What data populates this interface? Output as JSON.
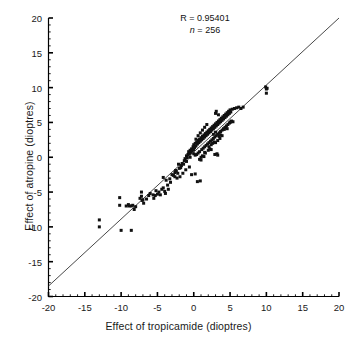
{
  "figure": {
    "kind": "scatter-plot",
    "background": "#ffffff",
    "ink_color": "#000000",
    "marker_color": "#111111",
    "line_color": "#333333"
  },
  "annotation": {
    "correlation_label": "R = 0.95401",
    "n_symbol": "n",
    "n_equals": " = ",
    "n_value": "256",
    "n_label": "n = 256"
  },
  "axes": {
    "x_title": "Effect of tropicamide (dioptres)",
    "y_title": "Effect of atropine (dioptres)",
    "x_ticks": [
      "-20",
      "-15",
      "-10",
      "-5",
      "0",
      "5",
      "10",
      "15",
      "20"
    ],
    "y_ticks": [
      "20",
      "15",
      "10",
      "5",
      "0",
      "-5",
      "-10",
      "-15",
      "-20"
    ]
  },
  "chart_data": {
    "type": "scatter",
    "title": "",
    "subtitle": "",
    "xlabel": "Effect of tropicamide (dioptres)",
    "ylabel": "Effect of atropine (dioptres)",
    "xlim": [
      -20,
      20
    ],
    "ylim": [
      -20,
      20
    ],
    "xticks": [
      -20,
      -15,
      -10,
      -5,
      0,
      5,
      10,
      15,
      20
    ],
    "yticks": [
      -20,
      -15,
      -10,
      -5,
      0,
      5,
      10,
      15,
      20
    ],
    "minor_ticks": true,
    "grid": false,
    "legend": false,
    "annotations": [
      {
        "text": "R = 0.95401",
        "x": 0.5,
        "y": 18.3
      },
      {
        "text": "n = 256",
        "x": 0.5,
        "y": 16.6
      }
    ],
    "statistics": {
      "R": 0.95401,
      "n": 256
    },
    "reference_line": {
      "name": "regression-line",
      "type": "line",
      "x": [
        -20,
        20
      ],
      "y": [
        -18.5,
        20.0
      ],
      "slope": 0.9625,
      "intercept": 0.75,
      "color": "#333333"
    },
    "marker": {
      "shape": "square",
      "size": 3,
      "color": "#111111"
    },
    "series": [
      {
        "name": "eyes",
        "points": [
          [
            -13.0,
            -9.0
          ],
          [
            -13.0,
            -10.0
          ],
          [
            -10.0,
            -10.5
          ],
          [
            -8.6,
            -10.5
          ],
          [
            -9.3,
            -7.0
          ],
          [
            -8.9,
            -7.0
          ],
          [
            -8.6,
            -7.0
          ],
          [
            -8.2,
            -7.5
          ],
          [
            -10.2,
            -5.8
          ],
          [
            -10.2,
            -6.9
          ],
          [
            -7.2,
            -5.0
          ],
          [
            -7.2,
            -5.6
          ],
          [
            -7.1,
            -6.2
          ],
          [
            -6.9,
            -6.6
          ],
          [
            -6.2,
            -5.5
          ],
          [
            -5.6,
            -5.4
          ],
          [
            -5.3,
            -5.5
          ],
          [
            -5.0,
            -5.3
          ],
          [
            -4.6,
            -5.4
          ],
          [
            -4.4,
            -4.6
          ],
          [
            -4.2,
            -4.4
          ],
          [
            -3.9,
            -5.2
          ],
          [
            -3.6,
            -4.0
          ],
          [
            -3.3,
            -3.1
          ],
          [
            -3.0,
            -2.5
          ],
          [
            -2.8,
            -2.6
          ],
          [
            -2.6,
            -2.2
          ],
          [
            -2.4,
            -2.0
          ],
          [
            -2.2,
            -2.3
          ],
          [
            -2.0,
            -1.6
          ],
          [
            -1.9,
            -2.8
          ],
          [
            -1.7,
            -1.2
          ],
          [
            -1.6,
            -0.9
          ],
          [
            -1.4,
            -1.0
          ],
          [
            -1.3,
            -0.5
          ],
          [
            -1.2,
            -0.2
          ],
          [
            -1.0,
            0.2
          ],
          [
            -0.9,
            -0.1
          ],
          [
            -0.8,
            0.4
          ],
          [
            -0.7,
            0.8
          ],
          [
            -0.6,
            0.5
          ],
          [
            -0.5,
            1.0
          ],
          [
            -0.4,
            0.7
          ],
          [
            -0.3,
            1.2
          ],
          [
            -0.2,
            0.9
          ],
          [
            -0.1,
            1.5
          ],
          [
            0.0,
            1.1
          ],
          [
            0.0,
            1.8
          ],
          [
            0.1,
            1.4
          ],
          [
            0.2,
            2.0
          ],
          [
            0.3,
            1.6
          ],
          [
            0.4,
            2.2
          ],
          [
            0.5,
            1.9
          ],
          [
            0.6,
            2.4
          ],
          [
            0.7,
            2.1
          ],
          [
            0.8,
            2.6
          ],
          [
            0.9,
            2.3
          ],
          [
            1.0,
            2.8
          ],
          [
            1.1,
            2.5
          ],
          [
            1.2,
            3.0
          ],
          [
            1.3,
            2.7
          ],
          [
            1.4,
            3.2
          ],
          [
            1.5,
            2.9
          ],
          [
            1.6,
            3.4
          ],
          [
            1.7,
            3.1
          ],
          [
            1.8,
            3.6
          ],
          [
            1.9,
            3.3
          ],
          [
            2.0,
            3.8
          ],
          [
            2.1,
            3.5
          ],
          [
            2.2,
            4.0
          ],
          [
            2.3,
            3.7
          ],
          [
            2.4,
            4.2
          ],
          [
            2.5,
            3.9
          ],
          [
            2.6,
            4.4
          ],
          [
            2.7,
            4.1
          ],
          [
            2.8,
            4.6
          ],
          [
            2.9,
            4.3
          ],
          [
            3.0,
            4.8
          ],
          [
            3.1,
            4.5
          ],
          [
            3.2,
            5.0
          ],
          [
            3.3,
            4.7
          ],
          [
            3.4,
            5.2
          ],
          [
            3.5,
            4.9
          ],
          [
            3.6,
            5.4
          ],
          [
            3.7,
            5.1
          ],
          [
            3.8,
            5.6
          ],
          [
            3.9,
            5.3
          ],
          [
            4.0,
            5.8
          ],
          [
            4.1,
            5.5
          ],
          [
            4.2,
            6.0
          ],
          [
            4.3,
            5.7
          ],
          [
            4.4,
            6.2
          ],
          [
            4.5,
            5.9
          ],
          [
            4.6,
            6.4
          ],
          [
            4.7,
            6.1
          ],
          [
            4.8,
            6.6
          ],
          [
            4.9,
            6.3
          ],
          [
            5.0,
            6.8
          ],
          [
            5.1,
            6.5
          ],
          [
            5.3,
            6.9
          ],
          [
            5.6,
            7.0
          ],
          [
            5.9,
            7.1
          ],
          [
            6.2,
            7.2
          ],
          [
            6.5,
            7.0
          ],
          [
            6.8,
            7.2
          ],
          [
            3.0,
            6.3
          ],
          [
            3.1,
            6.6
          ],
          [
            3.4,
            6.1
          ],
          [
            2.9,
            0.4
          ],
          [
            3.2,
            0.5
          ],
          [
            3.3,
            0.3
          ],
          [
            1.6,
            0.6
          ],
          [
            0.5,
            -3.5
          ],
          [
            0.9,
            -3.4
          ],
          [
            -0.3,
            -2.5
          ],
          [
            0.2,
            -2.4
          ],
          [
            -1.5,
            -2.3
          ],
          [
            -2.3,
            -3.0
          ],
          [
            -2.6,
            -2.8
          ],
          [
            9.9,
            10.1
          ],
          [
            10.0,
            9.8
          ],
          [
            10.0,
            9.2
          ],
          [
            10.1,
            9.9
          ],
          [
            1.0,
            0.0
          ],
          [
            1.2,
            0.2
          ],
          [
            1.4,
            0.1
          ],
          [
            2.0,
            1.0
          ],
          [
            2.2,
            1.2
          ],
          [
            2.4,
            1.1
          ],
          [
            2.6,
            2.0
          ],
          [
            2.8,
            2.2
          ],
          [
            3.0,
            2.1
          ],
          [
            3.5,
            3.0
          ],
          [
            3.7,
            3.2
          ],
          [
            3.9,
            3.1
          ],
          [
            4.2,
            4.0
          ],
          [
            4.4,
            4.2
          ],
          [
            4.6,
            4.1
          ],
          [
            5.0,
            5.0
          ],
          [
            5.2,
            5.2
          ],
          [
            5.4,
            5.1
          ],
          [
            0.0,
            0.5
          ],
          [
            0.2,
            0.3
          ],
          [
            -0.5,
            0.0
          ],
          [
            -1.0,
            -0.6
          ],
          [
            -1.8,
            -1.5
          ],
          [
            -2.5,
            -1.9
          ],
          [
            -3.2,
            -3.6
          ],
          [
            -3.8,
            -3.3
          ],
          [
            -4.0,
            -4.9
          ],
          [
            -4.8,
            -5.0
          ],
          [
            -5.2,
            -4.8
          ],
          [
            -6.0,
            -5.2
          ],
          [
            -6.5,
            -6.0
          ],
          [
            -7.0,
            -6.1
          ],
          [
            -7.4,
            -5.9
          ],
          [
            1.1,
            1.1
          ],
          [
            1.3,
            1.3
          ],
          [
            1.5,
            1.5
          ],
          [
            1.7,
            1.7
          ],
          [
            1.9,
            1.9
          ],
          [
            2.1,
            2.1
          ],
          [
            2.3,
            2.3
          ],
          [
            2.5,
            2.5
          ],
          [
            2.7,
            2.7
          ],
          [
            2.9,
            2.9
          ],
          [
            3.1,
            3.1
          ],
          [
            3.3,
            3.3
          ],
          [
            3.5,
            3.5
          ],
          [
            3.7,
            3.7
          ],
          [
            3.9,
            3.9
          ],
          [
            4.1,
            4.1
          ],
          [
            4.3,
            4.3
          ],
          [
            4.5,
            4.5
          ],
          [
            4.7,
            4.7
          ],
          [
            4.9,
            4.9
          ],
          [
            5.1,
            5.1
          ],
          [
            0.6,
            0.6
          ],
          [
            0.8,
            0.8
          ],
          [
            0.4,
            0.4
          ],
          [
            0.3,
            2.6
          ],
          [
            0.6,
            3.1
          ],
          [
            0.9,
            3.5
          ],
          [
            1.2,
            3.9
          ],
          [
            1.5,
            4.3
          ],
          [
            1.8,
            4.7
          ],
          [
            2.1,
            1.5
          ],
          [
            2.4,
            1.8
          ],
          [
            2.7,
            3.3
          ],
          [
            3.0,
            3.6
          ],
          [
            3.3,
            2.4
          ],
          [
            3.6,
            2.7
          ],
          [
            -2.1,
            -1.0
          ],
          [
            -1.1,
            -1.8
          ],
          [
            -0.6,
            -1.4
          ],
          [
            0.8,
            -0.3
          ],
          [
            1.0,
            -0.4
          ],
          [
            1.5,
            0.7
          ],
          [
            -4.2,
            -2.9
          ],
          [
            -3.5,
            -4.6
          ],
          [
            -5.5,
            -5.9
          ],
          [
            -8.0,
            -7.1
          ],
          [
            -8.4,
            -6.9
          ],
          [
            -9.0,
            -6.8
          ]
        ]
      }
    ]
  }
}
